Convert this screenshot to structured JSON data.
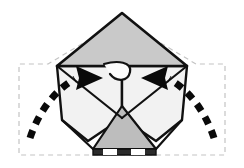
{
  "figure": {
    "canvas": {
      "width": 244,
      "height": 168,
      "background": "#ffffff"
    }
  },
  "palette": {
    "outline": "#111111",
    "paper_white": "#fbfbfb",
    "paper_light": "#f2f2f2",
    "paper_pale": "#ededed",
    "paper_gray": "#c9c9c9",
    "paper_midgray": "#bdbdbd",
    "paper_darkgray": "#a8a8a8",
    "ghost_dash": "#c4c4c4",
    "arrow_black": "#0a0a0a",
    "bottom_edge": "#2b2b2b"
  },
  "shapes": {
    "ghost_outline": {
      "name": "unfolded-position-outline",
      "style": "light gray dashed",
      "points": "122,20 196,64 225,64 225,155 19,155 19,64 48,64"
    },
    "top_triangle": {
      "name": "top-gray-triangle",
      "fill": "#c9c9c9",
      "points": "122,13 187,66 57,66"
    },
    "left_flap": {
      "name": "left-folded-flap",
      "fill": "#f2f2f2",
      "points": "57,66 122,66 122,118 88,141 62,120"
    },
    "right_flap": {
      "name": "right-folded-flap",
      "fill": "#f2f2f2",
      "points": "187,66 122,66 122,118 156,141 182,120"
    },
    "center_bottom_triangle": {
      "name": "center-bottom-gray-triangle",
      "fill": "#bdbdbd",
      "points": "122,106 156,149 93,149"
    },
    "bottom_edge_bar": {
      "name": "bottom-dark-edge",
      "fill": "#2b2b2b",
      "points": "93,149 156,149 156,155 93,155"
    }
  },
  "arrows": {
    "left": {
      "name": "left-curved-motion-arrow",
      "direction": "right",
      "dash_pattern": "8 7",
      "stroke_width": 7,
      "path": "M 30,138 C 40,108 58,88 75,79",
      "head_points": "103,78 76,66 79,78 76,90"
    },
    "right": {
      "name": "right-curved-motion-arrow",
      "direction": "left",
      "dash_pattern": "8 7",
      "stroke_width": 7,
      "path": "M 214,138 C 204,108 186,88 169,79",
      "head_points": "141,78 168,66 165,78 168,90"
    }
  },
  "creases": [
    {
      "name": "crease-left-diagonal",
      "path": "M 57,66 L 122,118"
    },
    {
      "name": "crease-right-diagonal",
      "path": "M 187,66 L 122,118"
    },
    {
      "name": "crease-center-vertical",
      "path": "M 122,66 L 122,106"
    },
    {
      "name": "crease-left-lower",
      "path": "M 62,120 L 93,149"
    },
    {
      "name": "crease-right-lower",
      "path": "M 182,120 L 156,149"
    },
    {
      "name": "crease-curl-center",
      "path": "M 104,64 C 118,60 132,62 130,72 C 128,82 116,82 110,74"
    }
  ],
  "labels": {
    "step_note": ""
  }
}
